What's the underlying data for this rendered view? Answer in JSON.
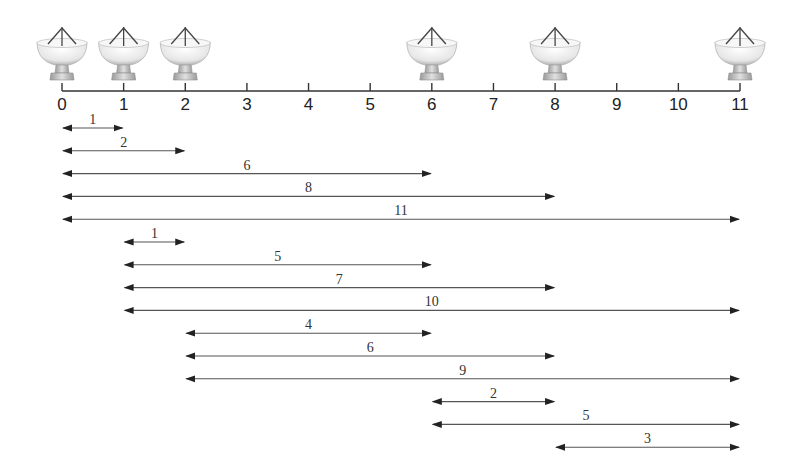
{
  "axis": {
    "ticks": [
      "0",
      "1",
      "2",
      "3",
      "4",
      "5",
      "6",
      "7",
      "8",
      "9",
      "10",
      "11"
    ],
    "min": 0,
    "max": 11,
    "color": "#333333"
  },
  "antennas": {
    "positions": [
      0,
      1,
      2,
      6,
      8,
      11
    ],
    "icon": "satellite-dish-icon"
  },
  "baselines": [
    {
      "start": 0,
      "end": 1,
      "label": "1"
    },
    {
      "start": 0,
      "end": 2,
      "label": "2"
    },
    {
      "start": 0,
      "end": 6,
      "label": "6"
    },
    {
      "start": 0,
      "end": 8,
      "label": "8"
    },
    {
      "start": 0,
      "end": 11,
      "label": "11"
    },
    {
      "start": 1,
      "end": 2,
      "label": "1"
    },
    {
      "start": 1,
      "end": 6,
      "label": "5"
    },
    {
      "start": 1,
      "end": 8,
      "label": "7"
    },
    {
      "start": 1,
      "end": 11,
      "label": "10"
    },
    {
      "start": 2,
      "end": 6,
      "label": "4"
    },
    {
      "start": 2,
      "end": 8,
      "label": "6"
    },
    {
      "start": 2,
      "end": 11,
      "label": "9"
    },
    {
      "start": 6,
      "end": 8,
      "label": "2"
    },
    {
      "start": 6,
      "end": 11,
      "label": "5"
    },
    {
      "start": 8,
      "end": 11,
      "label": "3"
    }
  ],
  "colors": {
    "line": "#555555",
    "arrow": "#222222",
    "dish_light": "#f2f2f2",
    "dish_mid": "#c8c8c8",
    "dish_dark": "#8a8a8a"
  }
}
